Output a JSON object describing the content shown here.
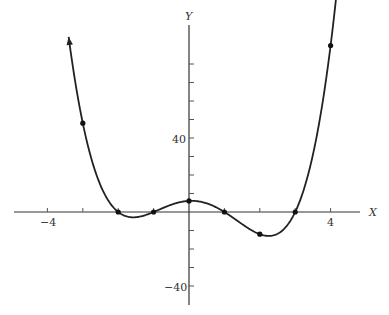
{
  "chart_data": {
    "type": "line",
    "title": "",
    "function": "y = (x+2)(x+1)(x-1)(x-3)",
    "xlabel": "X",
    "ylabel": "Y",
    "xlim": [
      -4.8,
      5.2
    ],
    "ylim": [
      -45,
      100
    ],
    "x_ticks": [
      -4,
      -3,
      -2,
      -1,
      0,
      1,
      2,
      3,
      4
    ],
    "x_tick_labels": [
      {
        "value": -4,
        "label": "−4"
      },
      {
        "value": 4,
        "label": "4"
      }
    ],
    "y_ticks": [
      -40,
      -30,
      -20,
      -10,
      0,
      10,
      20,
      30,
      40,
      50,
      60,
      70,
      80
    ],
    "y_tick_labels": [
      {
        "value": 40,
        "label": "40"
      },
      {
        "value": -40,
        "label": "−40"
      }
    ],
    "points": [
      {
        "x": -3,
        "y": 48
      },
      {
        "x": -2,
        "y": 0
      },
      {
        "x": -1,
        "y": 0
      },
      {
        "x": 0,
        "y": 6
      },
      {
        "x": 1,
        "y": 0
      },
      {
        "x": 2,
        "y": -12
      },
      {
        "x": 3,
        "y": 0
      },
      {
        "x": 4,
        "y": 90
      }
    ],
    "grid": false,
    "legend": null
  },
  "labels": {
    "x_axis": "X",
    "y_axis": "Y",
    "x_neg4": "−4",
    "x_pos4": "4",
    "y_40": "40",
    "y_neg40": "−40"
  }
}
